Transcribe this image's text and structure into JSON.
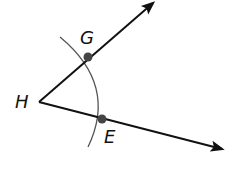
{
  "diagram": {
    "type": "angle-construction",
    "colors": {
      "ray": "#111111",
      "arc": "#555555",
      "point": "#444444",
      "label": "#111111"
    },
    "vertex": {
      "label": "H",
      "x": 39,
      "y": 102
    },
    "points": [
      {
        "label": "G",
        "x": 88,
        "y": 57
      },
      {
        "label": "E",
        "x": 102,
        "y": 119
      }
    ],
    "rays": [
      {
        "name": "ray-HG",
        "from": [
          39,
          102
        ],
        "to": [
          155,
          1
        ]
      },
      {
        "name": "ray-HE",
        "from": [
          39,
          102
        ],
        "to": [
          225,
          150
        ]
      }
    ],
    "arc": {
      "start": [
        60,
        37
      ],
      "control": [
        118,
        85
      ],
      "end": [
        88,
        147
      ]
    },
    "labels": {
      "H": "H",
      "G": "G",
      "E": "E"
    }
  }
}
